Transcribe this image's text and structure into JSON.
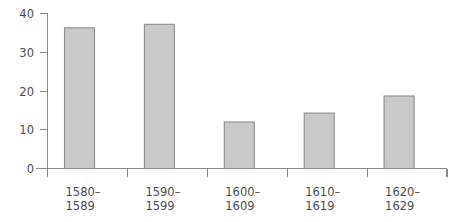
{
  "chart_data": {
    "type": "bar",
    "title": "",
    "subtitle": "",
    "xlabel": "",
    "ylabel": "",
    "categories": [
      "1580–\n1589",
      "1590–\n1599",
      "1600–\n1609",
      "1610–\n1619",
      "1620–\n1629"
    ],
    "category_lines": [
      [
        "1580–",
        "1589"
      ],
      [
        "1590–",
        "1599"
      ],
      [
        "1600–",
        "1609"
      ],
      [
        "1610–",
        "1619"
      ],
      [
        "1620–",
        "1629"
      ]
    ],
    "values": [
      36.3,
      37.2,
      12.0,
      14.3,
      18.7
    ],
    "ylim": [
      0,
      40
    ],
    "yticks": [
      0,
      10,
      20,
      30,
      40
    ],
    "ytick_labels": [
      "0",
      "10",
      "20",
      "30",
      "40"
    ],
    "grid": false,
    "legend": null,
    "legend_position": "none",
    "colors": {
      "bar_fill": "#c9c9c9",
      "bar_stroke": "#8c8c8c",
      "axis": "#8a8a8a",
      "text": "#4d4d4d",
      "background": "#ffffff"
    }
  },
  "axis": {
    "y_tick_labels": [
      "40",
      "30",
      "20",
      "10",
      "0"
    ]
  }
}
